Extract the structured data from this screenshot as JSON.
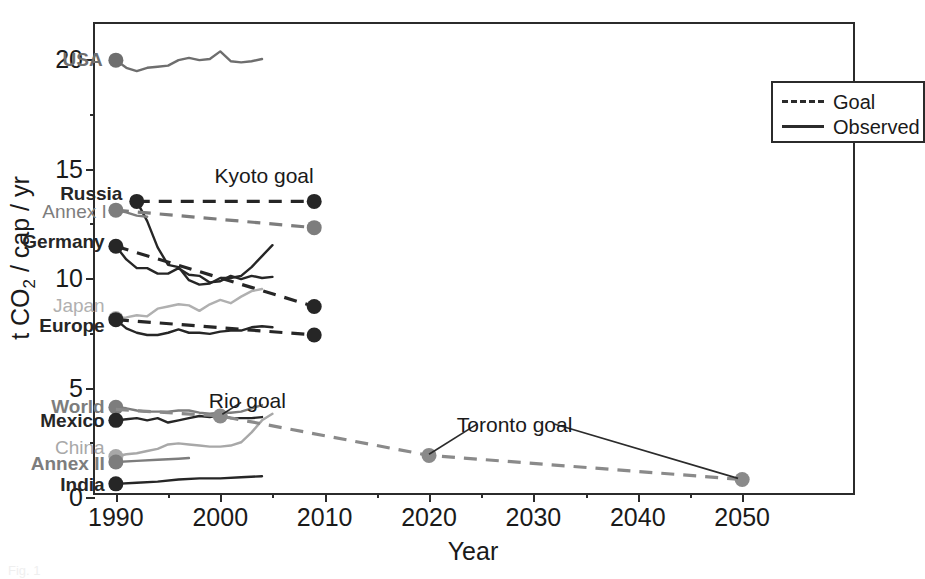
{
  "chart_data": {
    "type": "line",
    "title": "",
    "xlabel": "Year",
    "ylabel": "t CO2 / cap / yr",
    "xlim": [
      1988,
      2061
    ],
    "ylim": [
      0,
      21.6
    ],
    "xticks": [
      1990,
      2000,
      2010,
      2020,
      2030,
      2040,
      2050
    ],
    "xticklabels": [
      "1990",
      "2000",
      "2010",
      "2020",
      "2030",
      "2040",
      "2050"
    ],
    "xminorticks": [
      1995,
      2005,
      2015,
      2025,
      2035,
      2045
    ],
    "yticks": [
      0,
      5,
      10,
      15,
      20
    ],
    "yticklabels": [
      "0",
      "5",
      "10",
      "15",
      "20"
    ],
    "yminorticks": [
      2.5,
      7.5,
      12.5,
      17.5
    ],
    "grid": false,
    "legend": {
      "position": "top-right",
      "entries": [
        {
          "label": "Goal",
          "style": "dashed"
        },
        {
          "label": "Observed",
          "style": "solid"
        }
      ]
    },
    "annotations": [
      {
        "text": "Kyoto goal",
        "x": 2004.2,
        "y": 14.7
      },
      {
        "text": "Rio goal",
        "x": 2002.6,
        "y": 4.45
      },
      {
        "text": "Toronto goal",
        "x": 2028.2,
        "y": 3.35
      }
    ],
    "series": [
      {
        "name": "USA",
        "label": "USA",
        "label_x": 1989.4,
        "label_y": 20.0,
        "color": "#6e6e6e",
        "bold": true,
        "marker_year": 1990,
        "marker_value": 19.95,
        "observed": [
          {
            "x": 1990,
            "y": 19.95
          },
          {
            "x": 1991,
            "y": 19.6
          },
          {
            "x": 1992,
            "y": 19.45
          },
          {
            "x": 1993,
            "y": 19.6
          },
          {
            "x": 1994,
            "y": 19.65
          },
          {
            "x": 1995,
            "y": 19.7
          },
          {
            "x": 1996,
            "y": 19.95
          },
          {
            "x": 1997,
            "y": 20.05
          },
          {
            "x": 1998,
            "y": 19.95
          },
          {
            "x": 1999,
            "y": 20.0
          },
          {
            "x": 2000,
            "y": 20.35
          },
          {
            "x": 2001,
            "y": 19.9
          },
          {
            "x": 2002,
            "y": 19.85
          },
          {
            "x": 2003,
            "y": 19.9
          },
          {
            "x": 2004,
            "y": 20.0
          }
        ],
        "goal": []
      },
      {
        "name": "Russia",
        "label": "Russia",
        "label_x": 1991.3,
        "label_y": 13.9,
        "color": "#262626",
        "bold": true,
        "marker_year": 1992,
        "marker_value": 13.5,
        "observed": [
          {
            "x": 1992,
            "y": 13.5
          },
          {
            "x": 1993,
            "y": 12.6
          },
          {
            "x": 1994,
            "y": 11.4
          },
          {
            "x": 1995,
            "y": 10.6
          },
          {
            "x": 1996,
            "y": 10.5
          },
          {
            "x": 1997,
            "y": 9.9
          },
          {
            "x": 1998,
            "y": 9.7
          },
          {
            "x": 1999,
            "y": 9.75
          },
          {
            "x": 2000,
            "y": 10.0
          },
          {
            "x": 2001,
            "y": 10.0
          },
          {
            "x": 2002,
            "y": 10.1
          },
          {
            "x": 2003,
            "y": 10.5
          },
          {
            "x": 2004,
            "y": 11.0
          },
          {
            "x": 2005,
            "y": 11.5
          }
        ],
        "goal": [
          {
            "x": 1992,
            "y": 13.5
          },
          {
            "x": 2009,
            "y": 13.5
          }
        ],
        "goal_marker": {
          "x": 2009,
          "y": 13.5
        }
      },
      {
        "name": "Annex I",
        "label": "Annex I",
        "label_x": 1989.8,
        "label_y": 13.05,
        "color": "#7d7d7d",
        "bold": false,
        "marker_year": 1990,
        "marker_value": 13.1,
        "observed": [
          {
            "x": 1990,
            "y": 13.1
          },
          {
            "x": 1991,
            "y": 13.0
          },
          {
            "x": 1992,
            "y": 12.85
          },
          {
            "x": 1993,
            "y": 12.8
          }
        ],
        "goal": [
          {
            "x": 1990,
            "y": 13.1
          },
          {
            "x": 2009,
            "y": 12.3
          }
        ],
        "goal_marker": {
          "x": 2009,
          "y": 12.3
        }
      },
      {
        "name": "Germany",
        "label": "Germany",
        "label_x": 1989.6,
        "label_y": 11.7,
        "color": "#262626",
        "bold": true,
        "marker_year": 1990,
        "marker_value": 11.45,
        "observed": [
          {
            "x": 1990,
            "y": 11.45
          },
          {
            "x": 1991,
            "y": 10.85
          },
          {
            "x": 1992,
            "y": 10.45
          },
          {
            "x": 1993,
            "y": 10.45
          },
          {
            "x": 1994,
            "y": 10.2
          },
          {
            "x": 1995,
            "y": 10.2
          },
          {
            "x": 1996,
            "y": 10.45
          },
          {
            "x": 1997,
            "y": 10.15
          },
          {
            "x": 1998,
            "y": 10.1
          },
          {
            "x": 1999,
            "y": 9.8
          },
          {
            "x": 2000,
            "y": 9.85
          },
          {
            "x": 2001,
            "y": 10.1
          },
          {
            "x": 2002,
            "y": 9.95
          },
          {
            "x": 2003,
            "y": 10.1
          },
          {
            "x": 2004,
            "y": 10.0
          },
          {
            "x": 2005,
            "y": 10.05
          }
        ],
        "goal": [
          {
            "x": 1990,
            "y": 11.45
          },
          {
            "x": 2009,
            "y": 8.7
          }
        ],
        "goal_marker": {
          "x": 2009,
          "y": 8.7
        }
      },
      {
        "name": "Japan",
        "label": "Japan",
        "label_x": 1989.6,
        "label_y": 8.75,
        "color": "#b0b0b0",
        "bold": false,
        "marker_year": 1990,
        "marker_value": 8.15,
        "observed": [
          {
            "x": 1990,
            "y": 8.15
          },
          {
            "x": 1991,
            "y": 8.2
          },
          {
            "x": 1992,
            "y": 8.3
          },
          {
            "x": 1993,
            "y": 8.25
          },
          {
            "x": 1994,
            "y": 8.6
          },
          {
            "x": 1995,
            "y": 8.7
          },
          {
            "x": 1996,
            "y": 8.8
          },
          {
            "x": 1997,
            "y": 8.75
          },
          {
            "x": 1998,
            "y": 8.5
          },
          {
            "x": 1999,
            "y": 8.8
          },
          {
            "x": 2000,
            "y": 9.0
          },
          {
            "x": 2001,
            "y": 8.85
          },
          {
            "x": 2002,
            "y": 9.15
          },
          {
            "x": 2003,
            "y": 9.4
          },
          {
            "x": 2004,
            "y": 9.5
          }
        ],
        "goal": []
      },
      {
        "name": "Europe",
        "label": "Europe",
        "label_x": 1989.6,
        "label_y": 7.85,
        "color": "#262626",
        "bold": true,
        "marker_year": 1990,
        "marker_value": 8.1,
        "observed": [
          {
            "x": 1990,
            "y": 8.1
          },
          {
            "x": 1991,
            "y": 7.7
          },
          {
            "x": 1992,
            "y": 7.5
          },
          {
            "x": 1993,
            "y": 7.4
          },
          {
            "x": 1994,
            "y": 7.4
          },
          {
            "x": 1995,
            "y": 7.5
          },
          {
            "x": 1996,
            "y": 7.65
          },
          {
            "x": 1997,
            "y": 7.5
          },
          {
            "x": 1998,
            "y": 7.5
          },
          {
            "x": 1999,
            "y": 7.45
          },
          {
            "x": 2000,
            "y": 7.55
          },
          {
            "x": 2001,
            "y": 7.6
          },
          {
            "x": 2002,
            "y": 7.6
          },
          {
            "x": 2003,
            "y": 7.75
          },
          {
            "x": 2004,
            "y": 7.8
          },
          {
            "x": 2005,
            "y": 7.75
          }
        ],
        "goal": [
          {
            "x": 1990,
            "y": 8.1
          },
          {
            "x": 2009,
            "y": 7.4
          }
        ],
        "goal_marker": {
          "x": 2009,
          "y": 7.4
        }
      },
      {
        "name": "World",
        "label": "World",
        "label_x": 1989.6,
        "label_y": 4.15,
        "color": "#7d7d7d",
        "bold": true,
        "marker_year": 1990,
        "marker_value": 4.1,
        "observed": [
          {
            "x": 1990,
            "y": 4.1
          },
          {
            "x": 1991,
            "y": 4.05
          },
          {
            "x": 1992,
            "y": 3.95
          },
          {
            "x": 1993,
            "y": 3.9
          },
          {
            "x": 1994,
            "y": 3.9
          },
          {
            "x": 1995,
            "y": 3.9
          },
          {
            "x": 1996,
            "y": 3.95
          },
          {
            "x": 1997,
            "y": 3.95
          },
          {
            "x": 1998,
            "y": 3.85
          },
          {
            "x": 1999,
            "y": 3.8
          },
          {
            "x": 2000,
            "y": 3.85
          },
          {
            "x": 2001,
            "y": 3.85
          },
          {
            "x": 2002,
            "y": 3.9
          },
          {
            "x": 2003,
            "y": 4.05
          },
          {
            "x": 2004,
            "y": 4.2
          }
        ],
        "goal": []
      },
      {
        "name": "Mexico",
        "label": "Mexico",
        "label_x": 1989.6,
        "label_y": 3.5,
        "color": "#262626",
        "bold": true,
        "marker_year": 1990,
        "marker_value": 3.5,
        "observed": [
          {
            "x": 1990,
            "y": 3.5
          },
          {
            "x": 1991,
            "y": 3.55
          },
          {
            "x": 1992,
            "y": 3.6
          },
          {
            "x": 1993,
            "y": 3.5
          },
          {
            "x": 1994,
            "y": 3.6
          },
          {
            "x": 1995,
            "y": 3.4
          },
          {
            "x": 1996,
            "y": 3.5
          },
          {
            "x": 1997,
            "y": 3.6
          },
          {
            "x": 1998,
            "y": 3.7
          },
          {
            "x": 1999,
            "y": 3.65
          },
          {
            "x": 2000,
            "y": 3.75
          },
          {
            "x": 2001,
            "y": 3.6
          },
          {
            "x": 2002,
            "y": 3.6
          },
          {
            "x": 2003,
            "y": 3.6
          },
          {
            "x": 2004,
            "y": 3.65
          }
        ],
        "goal": []
      },
      {
        "name": "China",
        "label": "China",
        "label_x": 1989.6,
        "label_y": 2.3,
        "color": "#a8a8a8",
        "bold": false,
        "marker_year": 1990,
        "marker_value": 1.85,
        "observed": [
          {
            "x": 1990,
            "y": 1.85
          },
          {
            "x": 1991,
            "y": 1.95
          },
          {
            "x": 1992,
            "y": 2.0
          },
          {
            "x": 1993,
            "y": 2.1
          },
          {
            "x": 1994,
            "y": 2.2
          },
          {
            "x": 1995,
            "y": 2.4
          },
          {
            "x": 1996,
            "y": 2.45
          },
          {
            "x": 1997,
            "y": 2.4
          },
          {
            "x": 1998,
            "y": 2.35
          },
          {
            "x": 1999,
            "y": 2.3
          },
          {
            "x": 2000,
            "y": 2.3
          },
          {
            "x": 2001,
            "y": 2.35
          },
          {
            "x": 2002,
            "y": 2.5
          },
          {
            "x": 2003,
            "y": 2.95
          },
          {
            "x": 2004,
            "y": 3.5
          },
          {
            "x": 2005,
            "y": 3.8
          }
        ],
        "goal": []
      },
      {
        "name": "Annex II",
        "label": "Annex II",
        "label_x": 1989.6,
        "label_y": 1.55,
        "color": "#7d7d7d",
        "bold": true,
        "marker_year": 1990,
        "marker_value": 1.6,
        "observed": [
          {
            "x": 1990,
            "y": 1.6
          },
          {
            "x": 1992,
            "y": 1.65
          },
          {
            "x": 1994,
            "y": 1.7
          },
          {
            "x": 1996,
            "y": 1.75
          },
          {
            "x": 1997,
            "y": 1.78
          }
        ],
        "goal": []
      },
      {
        "name": "India",
        "label": "India",
        "label_x": 1989.6,
        "label_y": 0.6,
        "color": "#262626",
        "bold": true,
        "marker_year": 1990,
        "marker_value": 0.6,
        "observed": [
          {
            "x": 1990,
            "y": 0.6
          },
          {
            "x": 1992,
            "y": 0.65
          },
          {
            "x": 1994,
            "y": 0.7
          },
          {
            "x": 1996,
            "y": 0.8
          },
          {
            "x": 1998,
            "y": 0.85
          },
          {
            "x": 2000,
            "y": 0.85
          },
          {
            "x": 2002,
            "y": 0.9
          },
          {
            "x": 2004,
            "y": 0.95
          }
        ],
        "goal": []
      },
      {
        "name": "Toronto goal line",
        "label": "",
        "color": "#8a8a8a",
        "bold": false,
        "observed": [],
        "goal": [
          {
            "x": 1990,
            "y": 4.0
          },
          {
            "x": 2000,
            "y": 3.7
          },
          {
            "x": 2020,
            "y": 1.9
          },
          {
            "x": 2050,
            "y": 0.8
          }
        ],
        "goal_markers": [
          {
            "x": 2000,
            "y": 3.7
          },
          {
            "x": 2020,
            "y": 1.9
          },
          {
            "x": 2050,
            "y": 0.8
          }
        ]
      }
    ]
  },
  "axes": {
    "ylabel_pre": "t CO",
    "ylabel_sub": "2",
    "ylabel_post": " / cap / yr",
    "xlabel": "Year"
  },
  "legend": {
    "goal_label": "Goal",
    "observed_label": "Observed"
  },
  "caption": "Fig. 1"
}
